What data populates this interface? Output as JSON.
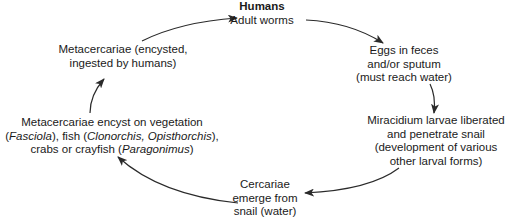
{
  "diagram": {
    "type": "life-cycle",
    "nodes": [
      {
        "id": "humans",
        "title": "Humans",
        "lines": [
          "Adult worms"
        ]
      },
      {
        "id": "eggs",
        "lines": [
          "Eggs in feces",
          "and/or sputum",
          "(must reach water)"
        ]
      },
      {
        "id": "miracidium",
        "lines": [
          "Miracidium larvae liberated",
          "and penetrate snail",
          "(development of various",
          "other larval forms)"
        ]
      },
      {
        "id": "cercariae",
        "lines": [
          "Cercariae",
          "emerge from",
          "snail (water)"
        ]
      },
      {
        "id": "encyst",
        "lines": [
          "Metacercariae encyst on vegetation",
          [
            "(",
            {
              "i": "Fasciola"
            },
            "), fish (",
            {
              "i": "Clonorchis, Opisthorchis"
            },
            "),"
          ],
          [
            "crabs or crayfish (",
            {
              "i": "Paragonimus"
            },
            ")"
          ]
        ]
      },
      {
        "id": "metacercariae",
        "lines": [
          "Metacercariae (encysted,",
          "ingested by humans)"
        ]
      }
    ],
    "edges": [
      {
        "from": "humans",
        "to": "eggs"
      },
      {
        "from": "eggs",
        "to": "miracidium"
      },
      {
        "from": "miracidium",
        "to": "cercariae"
      },
      {
        "from": "cercariae",
        "to": "encyst"
      },
      {
        "from": "encyst",
        "to": "metacercariae"
      },
      {
        "from": "metacercariae",
        "to": "humans"
      }
    ],
    "colors": {
      "stroke": "#2a2a2a",
      "text": "#1a1a1a",
      "background": "#ffffff"
    }
  },
  "labels": {
    "humans_title": "Humans",
    "humans_line1": "Adult worms",
    "eggs_line1": "Eggs in feces",
    "eggs_line2": "and/or sputum",
    "eggs_line3": "(must reach water)",
    "mira_line1": "Miracidium larvae liberated",
    "mira_line2": "and penetrate snail",
    "mira_line3": "(development of various",
    "mira_line4": "other larval forms)",
    "cerc_line1": "Cercariae",
    "cerc_line2": "emerge from",
    "cerc_line3": "snail (water)",
    "enc_line1": "Metacercariae encyst on vegetation",
    "enc_l2_a": "(",
    "enc_l2_b": "Fasciola",
    "enc_l2_c": "), fish (",
    "enc_l2_d": "Clonorchis, Opisthorchis",
    "enc_l2_e": "),",
    "enc_l3_a": "crabs or crayfish (",
    "enc_l3_b": "Paragonimus",
    "enc_l3_c": ")",
    "meta_line1": "Metacercariae (encysted,",
    "meta_line2": "ingested by humans)"
  }
}
